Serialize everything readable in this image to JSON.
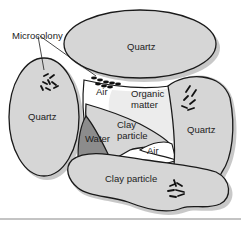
{
  "diagram": {
    "labels": {
      "microcolony": "Microcolony",
      "quartz_top": "Quartz",
      "quartz_left": "Quartz",
      "quartz_right": "Quartz",
      "air_top": "Air",
      "organic_1": "Organic",
      "organic_2": "matter",
      "clay_center_1": "Clay",
      "clay_center_2": "particle",
      "water": "Water",
      "air_bottom": "Air",
      "clay_bottom": "Clay particle"
    },
    "colors": {
      "particle_fill": "#d6d6d6",
      "water_fill": "#8c8c8c",
      "air_fill": "#ffffff",
      "outline": "#1a1a1a",
      "bacteria": "#111111",
      "rule": "#888888"
    }
  }
}
